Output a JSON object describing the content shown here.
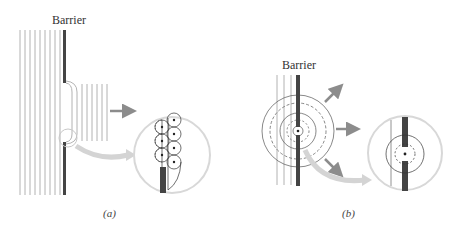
{
  "panels": [
    {
      "id": "a",
      "barrier_label": "Barrier",
      "caption": "(a)",
      "description": "Plane waves passing through a wide opening in a barrier; Huygens wavelets shown in magnified inset at the edge"
    },
    {
      "id": "b",
      "barrier_label": "Barrier",
      "caption": "(b)",
      "description": "Plane waves passing through a narrow opening; circular wavefronts spread from the point source with arrows in three directions; magnified inset of the opening"
    }
  ],
  "colors": {
    "barrier": "#444444",
    "wave_lines": "#9a9a9a",
    "inset_circle": "#d8d8d8",
    "arrow": "#8c8c8c",
    "big_arrow": "#d0d0d0"
  }
}
